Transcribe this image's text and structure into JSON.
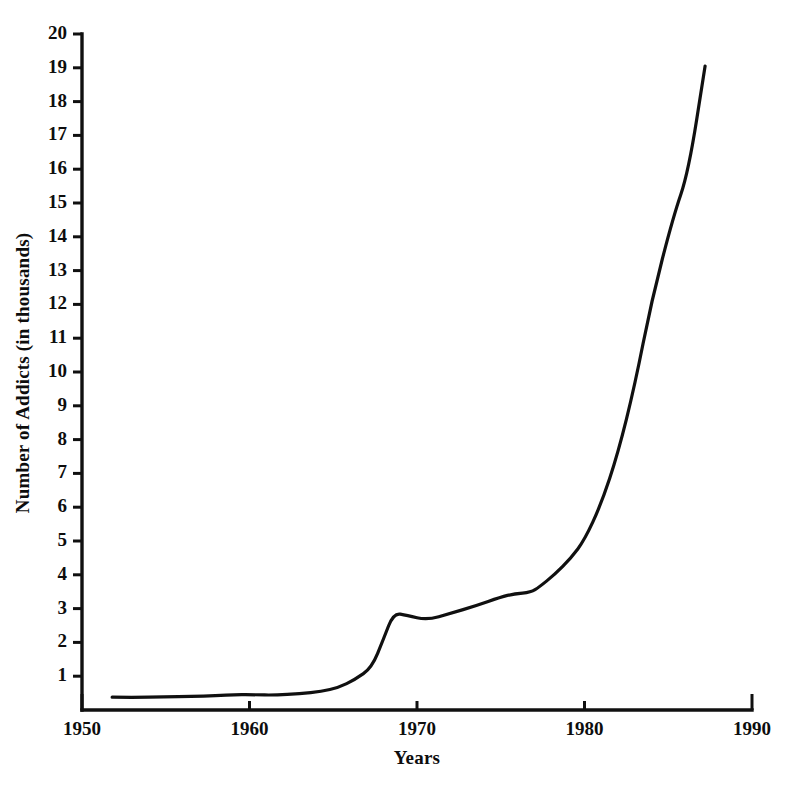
{
  "chart_data": {
    "type": "line",
    "title": "",
    "xlabel": "Years",
    "ylabel": "Number of Addicts (in thousands)",
    "xlim": [
      1950,
      1990
    ],
    "ylim": [
      0,
      20
    ],
    "xticks": [
      1950,
      1960,
      1970,
      1980,
      1990
    ],
    "yticks": [
      1,
      2,
      3,
      4,
      5,
      6,
      7,
      8,
      9,
      10,
      11,
      12,
      13,
      14,
      15,
      16,
      17,
      18,
      19,
      20
    ],
    "grid": false,
    "legend": null,
    "line_color": "#101010",
    "line_width": 3.2,
    "series": [
      {
        "name": "Number of Addicts (in thousands)",
        "x": [
          1951.8,
          1953.0,
          1955.0,
          1956.5,
          1958.0,
          1959.2,
          1960.3,
          1961.5,
          1963.0,
          1964.3,
          1965.3,
          1966.3,
          1967.3,
          1968.0,
          1968.6,
          1969.4,
          1970.6,
          1972.0,
          1973.5,
          1975.0,
          1975.8,
          1976.8,
          1977.3,
          1978.2,
          1979.2,
          1980.0,
          1981.0,
          1982.0,
          1983.0,
          1984.0,
          1985.3,
          1986.2,
          1987.2
        ],
        "y": [
          0.38,
          0.37,
          0.39,
          0.4,
          0.42,
          0.46,
          0.45,
          0.44,
          0.48,
          0.55,
          0.66,
          0.9,
          1.25,
          2.1,
          2.87,
          2.8,
          2.66,
          2.86,
          3.08,
          3.34,
          3.44,
          3.48,
          3.64,
          4.0,
          4.5,
          5.03,
          6.1,
          7.6,
          9.6,
          12.1,
          14.6,
          15.9,
          19.05
        ]
      }
    ]
  },
  "axes": {
    "y_axis_name": "y-axis",
    "x_axis_name": "x-axis"
  },
  "geometry": {
    "x0_px": 82,
    "y0_px": 710,
    "px_per_year": 16.75,
    "px_per_unit": 33.8
  }
}
